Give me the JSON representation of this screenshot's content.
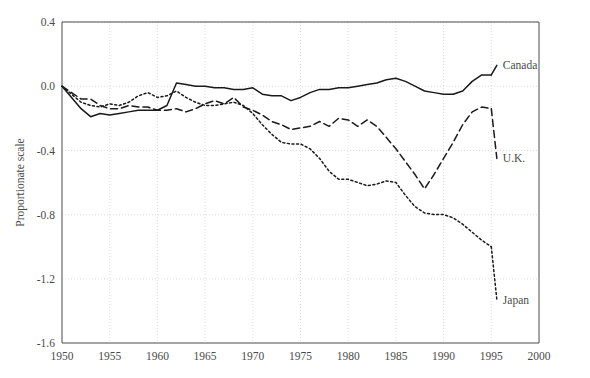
{
  "chart_data": {
    "type": "line",
    "title": "",
    "xlabel": "",
    "ylabel": "Proportionate scale",
    "xlim": [
      1950,
      2000
    ],
    "ylim": [
      -1.6,
      0.4
    ],
    "grid": true,
    "legend_position": "right-inline-labels",
    "x_ticks": [
      "1950",
      "1955",
      "1960",
      "1965",
      "1970",
      "1975",
      "1980",
      "1985",
      "1990",
      "1995",
      "2000"
    ],
    "y_ticks": [
      "0.4",
      "0.0",
      "-0.4",
      "-0.8",
      "-1.2",
      "-1.6"
    ],
    "series": [
      {
        "name": "Canada",
        "style": "solid",
        "color": "#1a1a1a",
        "label_x": 1996,
        "label_y": 0.13,
        "x": [
          1950,
          1951,
          1952,
          1953,
          1954,
          1955,
          1956,
          1957,
          1958,
          1959,
          1960,
          1961,
          1962,
          1963,
          1964,
          1965,
          1966,
          1967,
          1968,
          1969,
          1970,
          1971,
          1972,
          1973,
          1974,
          1975,
          1976,
          1977,
          1978,
          1979,
          1980,
          1981,
          1982,
          1983,
          1984,
          1985,
          1986,
          1987,
          1988,
          1989,
          1990,
          1991,
          1992,
          1993,
          1994,
          1995
        ],
        "y": [
          0.0,
          -0.07,
          -0.14,
          -0.19,
          -0.17,
          -0.18,
          -0.17,
          -0.16,
          -0.15,
          -0.15,
          -0.15,
          -0.12,
          0.02,
          0.01,
          0.0,
          0.0,
          -0.01,
          -0.01,
          -0.02,
          -0.02,
          -0.01,
          -0.05,
          -0.06,
          -0.06,
          -0.09,
          -0.07,
          -0.04,
          -0.02,
          -0.02,
          -0.01,
          -0.01,
          0.0,
          0.01,
          0.02,
          0.04,
          0.05,
          0.03,
          0.0,
          -0.03,
          -0.04,
          -0.05,
          -0.05,
          -0.03,
          0.03,
          0.07,
          0.07
        ]
      },
      {
        "name": "U.K.",
        "style": "dashed",
        "color": "#1a1a1a",
        "label_x": 1996,
        "label_y": -0.45,
        "x": [
          1950,
          1951,
          1952,
          1953,
          1954,
          1955,
          1956,
          1957,
          1958,
          1959,
          1960,
          1961,
          1962,
          1963,
          1964,
          1965,
          1966,
          1967,
          1968,
          1969,
          1970,
          1971,
          1972,
          1973,
          1974,
          1975,
          1976,
          1977,
          1978,
          1979,
          1980,
          1981,
          1982,
          1983,
          1984,
          1985,
          1986,
          1987,
          1988,
          1989,
          1990,
          1991,
          1992,
          1993,
          1994,
          1995
        ],
        "y": [
          0.0,
          -0.04,
          -0.08,
          -0.08,
          -0.12,
          -0.14,
          -0.14,
          -0.12,
          -0.13,
          -0.13,
          -0.15,
          -0.15,
          -0.14,
          -0.16,
          -0.14,
          -0.11,
          -0.09,
          -0.11,
          -0.07,
          -0.13,
          -0.15,
          -0.18,
          -0.22,
          -0.24,
          -0.27,
          -0.26,
          -0.25,
          -0.22,
          -0.25,
          -0.2,
          -0.21,
          -0.25,
          -0.21,
          -0.25,
          -0.32,
          -0.39,
          -0.47,
          -0.55,
          -0.64,
          -0.55,
          -0.45,
          -0.35,
          -0.24,
          -0.16,
          -0.13,
          -0.14
        ]
      },
      {
        "name": "Japan",
        "style": "dotted",
        "color": "#1a1a1a",
        "label_x": 1996,
        "label_y": -1.33,
        "x": [
          1950,
          1951,
          1952,
          1953,
          1954,
          1955,
          1956,
          1957,
          1958,
          1959,
          1960,
          1961,
          1962,
          1963,
          1964,
          1965,
          1966,
          1967,
          1968,
          1969,
          1970,
          1971,
          1972,
          1973,
          1974,
          1975,
          1976,
          1977,
          1978,
          1979,
          1980,
          1981,
          1982,
          1983,
          1984,
          1985,
          1986,
          1987,
          1988,
          1989,
          1990,
          1991,
          1992,
          1993,
          1994,
          1995
        ],
        "y": [
          0.0,
          -0.05,
          -0.1,
          -0.12,
          -0.13,
          -0.11,
          -0.12,
          -0.1,
          -0.06,
          -0.04,
          -0.07,
          -0.06,
          -0.03,
          -0.07,
          -0.1,
          -0.12,
          -0.12,
          -0.11,
          -0.1,
          -0.12,
          -0.17,
          -0.24,
          -0.3,
          -0.35,
          -0.36,
          -0.36,
          -0.39,
          -0.45,
          -0.53,
          -0.58,
          -0.58,
          -0.6,
          -0.62,
          -0.61,
          -0.59,
          -0.6,
          -0.68,
          -0.75,
          -0.79,
          -0.8,
          -0.8,
          -0.82,
          -0.86,
          -0.91,
          -0.96,
          -1.0
        ]
      }
    ],
    "series_reversed_note": ""
  },
  "plot_geometry": {
    "left": 62,
    "right": 539,
    "top": 22,
    "bottom": 343
  }
}
